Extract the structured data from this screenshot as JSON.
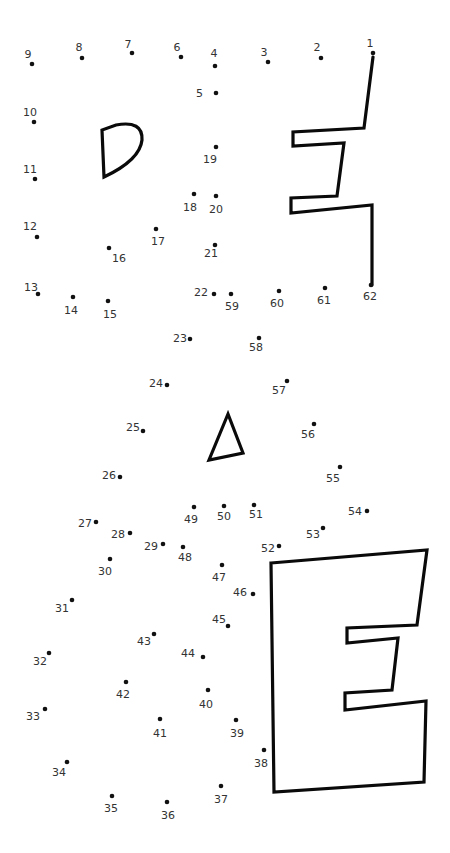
{
  "puzzle": {
    "type": "connect-the-dots",
    "dot_color": "#111111",
    "line_color": "#0a0a0a",
    "dots": [
      {
        "n": "1",
        "x": 373,
        "y": 53,
        "lx": 370,
        "ly": 47,
        "anchor": "middle"
      },
      {
        "n": "2",
        "x": 321,
        "y": 58,
        "lx": 317,
        "ly": 51,
        "anchor": "middle"
      },
      {
        "n": "3",
        "x": 268,
        "y": 62,
        "lx": 264,
        "ly": 56,
        "anchor": "middle"
      },
      {
        "n": "4",
        "x": 215,
        "y": 66,
        "lx": 214,
        "ly": 57,
        "anchor": "middle"
      },
      {
        "n": "5",
        "x": 216,
        "y": 93,
        "lx": 203,
        "ly": 97,
        "anchor": "end"
      },
      {
        "n": "6",
        "x": 181,
        "y": 57,
        "lx": 177,
        "ly": 51,
        "anchor": "middle"
      },
      {
        "n": "7",
        "x": 132,
        "y": 53,
        "lx": 128,
        "ly": 48,
        "anchor": "middle"
      },
      {
        "n": "8",
        "x": 82,
        "y": 58,
        "lx": 79,
        "ly": 51,
        "anchor": "middle"
      },
      {
        "n": "9",
        "x": 32,
        "y": 64,
        "lx": 28,
        "ly": 58,
        "anchor": "middle"
      },
      {
        "n": "10",
        "x": 34,
        "y": 122,
        "lx": 30,
        "ly": 116,
        "anchor": "middle"
      },
      {
        "n": "11",
        "x": 35,
        "y": 179,
        "lx": 30,
        "ly": 173,
        "anchor": "middle"
      },
      {
        "n": "12",
        "x": 37,
        "y": 237,
        "lx": 30,
        "ly": 230,
        "anchor": "middle"
      },
      {
        "n": "13",
        "x": 38,
        "y": 294,
        "lx": 31,
        "ly": 291,
        "anchor": "middle"
      },
      {
        "n": "14",
        "x": 73,
        "y": 297,
        "lx": 71,
        "ly": 314,
        "anchor": "middle"
      },
      {
        "n": "15",
        "x": 108,
        "y": 301,
        "lx": 110,
        "ly": 318,
        "anchor": "middle"
      },
      {
        "n": "16",
        "x": 109,
        "y": 248,
        "lx": 119,
        "ly": 262,
        "anchor": "middle"
      },
      {
        "n": "17",
        "x": 156,
        "y": 229,
        "lx": 158,
        "ly": 245,
        "anchor": "middle"
      },
      {
        "n": "18",
        "x": 194,
        "y": 194,
        "lx": 190,
        "ly": 211,
        "anchor": "middle"
      },
      {
        "n": "19",
        "x": 216,
        "y": 147,
        "lx": 210,
        "ly": 163,
        "anchor": "middle"
      },
      {
        "n": "20",
        "x": 216,
        "y": 196,
        "lx": 216,
        "ly": 213,
        "anchor": "middle"
      },
      {
        "n": "21",
        "x": 215,
        "y": 245,
        "lx": 211,
        "ly": 257,
        "anchor": "middle"
      },
      {
        "n": "22",
        "x": 214,
        "y": 294,
        "lx": 201,
        "ly": 296,
        "anchor": "middle"
      },
      {
        "n": "23",
        "x": 190,
        "y": 339,
        "lx": 180,
        "ly": 342,
        "anchor": "middle"
      },
      {
        "n": "24",
        "x": 167,
        "y": 385,
        "lx": 156,
        "ly": 387,
        "anchor": "middle"
      },
      {
        "n": "25",
        "x": 143,
        "y": 431,
        "lx": 133,
        "ly": 431,
        "anchor": "middle"
      },
      {
        "n": "26",
        "x": 120,
        "y": 477,
        "lx": 109,
        "ly": 479,
        "anchor": "middle"
      },
      {
        "n": "27",
        "x": 96,
        "y": 522,
        "lx": 85,
        "ly": 527,
        "anchor": "middle"
      },
      {
        "n": "28",
        "x": 130,
        "y": 533,
        "lx": 118,
        "ly": 538,
        "anchor": "middle"
      },
      {
        "n": "29",
        "x": 163,
        "y": 544,
        "lx": 151,
        "ly": 550,
        "anchor": "middle"
      },
      {
        "n": "30",
        "x": 110,
        "y": 559,
        "lx": 105,
        "ly": 575,
        "anchor": "middle"
      },
      {
        "n": "31",
        "x": 72,
        "y": 600,
        "lx": 62,
        "ly": 612,
        "anchor": "middle"
      },
      {
        "n": "32",
        "x": 49,
        "y": 653,
        "lx": 40,
        "ly": 665,
        "anchor": "middle"
      },
      {
        "n": "33",
        "x": 45,
        "y": 709,
        "lx": 33,
        "ly": 720,
        "anchor": "middle"
      },
      {
        "n": "34",
        "x": 67,
        "y": 762,
        "lx": 59,
        "ly": 776,
        "anchor": "middle"
      },
      {
        "n": "35",
        "x": 112,
        "y": 796,
        "lx": 111,
        "ly": 812,
        "anchor": "middle"
      },
      {
        "n": "36",
        "x": 167,
        "y": 802,
        "lx": 168,
        "ly": 819,
        "anchor": "middle"
      },
      {
        "n": "37",
        "x": 221,
        "y": 786,
        "lx": 221,
        "ly": 803,
        "anchor": "middle"
      },
      {
        "n": "38",
        "x": 264,
        "y": 750,
        "lx": 261,
        "ly": 767,
        "anchor": "middle"
      },
      {
        "n": "39",
        "x": 236,
        "y": 720,
        "lx": 237,
        "ly": 737,
        "anchor": "middle"
      },
      {
        "n": "40",
        "x": 208,
        "y": 690,
        "lx": 206,
        "ly": 708,
        "anchor": "middle"
      },
      {
        "n": "41",
        "x": 160,
        "y": 719,
        "lx": 160,
        "ly": 737,
        "anchor": "middle"
      },
      {
        "n": "42",
        "x": 126,
        "y": 682,
        "lx": 123,
        "ly": 698,
        "anchor": "middle"
      },
      {
        "n": "43",
        "x": 154,
        "y": 634,
        "lx": 144,
        "ly": 645,
        "anchor": "middle"
      },
      {
        "n": "44",
        "x": 203,
        "y": 657,
        "lx": 188,
        "ly": 657,
        "anchor": "middle"
      },
      {
        "n": "45",
        "x": 228,
        "y": 626,
        "lx": 219,
        "ly": 623,
        "anchor": "middle"
      },
      {
        "n": "46",
        "x": 253,
        "y": 594,
        "lx": 240,
        "ly": 596,
        "anchor": "middle"
      },
      {
        "n": "47",
        "x": 222,
        "y": 565,
        "lx": 219,
        "ly": 581,
        "anchor": "middle"
      },
      {
        "n": "48",
        "x": 183,
        "y": 547,
        "lx": 185,
        "ly": 561,
        "anchor": "middle"
      },
      {
        "n": "49",
        "x": 194,
        "y": 507,
        "lx": 191,
        "ly": 523,
        "anchor": "middle"
      },
      {
        "n": "50",
        "x": 224,
        "y": 506,
        "lx": 224,
        "ly": 520,
        "anchor": "middle"
      },
      {
        "n": "51",
        "x": 254,
        "y": 505,
        "lx": 256,
        "ly": 518,
        "anchor": "middle"
      },
      {
        "n": "52",
        "x": 279,
        "y": 546,
        "lx": 268,
        "ly": 552,
        "anchor": "middle"
      },
      {
        "n": "53",
        "x": 323,
        "y": 528,
        "lx": 313,
        "ly": 538,
        "anchor": "middle"
      },
      {
        "n": "54",
        "x": 367,
        "y": 511,
        "lx": 355,
        "ly": 515,
        "anchor": "middle"
      },
      {
        "n": "55",
        "x": 340,
        "y": 467,
        "lx": 333,
        "ly": 482,
        "anchor": "middle"
      },
      {
        "n": "56",
        "x": 314,
        "y": 424,
        "lx": 308,
        "ly": 438,
        "anchor": "middle"
      },
      {
        "n": "57",
        "x": 287,
        "y": 381,
        "lx": 279,
        "ly": 394,
        "anchor": "middle"
      },
      {
        "n": "58",
        "x": 259,
        "y": 338,
        "lx": 256,
        "ly": 351,
        "anchor": "middle"
      },
      {
        "n": "59",
        "x": 231,
        "y": 294,
        "lx": 232,
        "ly": 310,
        "anchor": "middle"
      },
      {
        "n": "60",
        "x": 279,
        "y": 291,
        "lx": 277,
        "ly": 307,
        "anchor": "middle"
      },
      {
        "n": "61",
        "x": 325,
        "y": 288,
        "lx": 324,
        "ly": 304,
        "anchor": "middle"
      },
      {
        "n": "62",
        "x": 371,
        "y": 285,
        "lx": 370,
        "ly": 300,
        "anchor": "middle"
      }
    ],
    "shapes": [
      {
        "name": "d-shape",
        "points": "M102,130 L104,177 Q140,160 142,140 Q143,120 116,125 Z"
      },
      {
        "name": "stepped-line-top-right",
        "points": "M373,57 L364,128 L293,132 L293,146 L344,143 L337,196 L291,198 L291,213 L372,205 L372,285"
      },
      {
        "name": "triangle",
        "points": "M228,414 L209,460 L243,453 Z"
      },
      {
        "name": "e-shape",
        "points": "M271,563 L427,550 L417,625 L347,628 L347,643 L398,638 L392,690 L345,693 L345,710 L426,701 L424,782 L274,792 Z"
      }
    ]
  }
}
